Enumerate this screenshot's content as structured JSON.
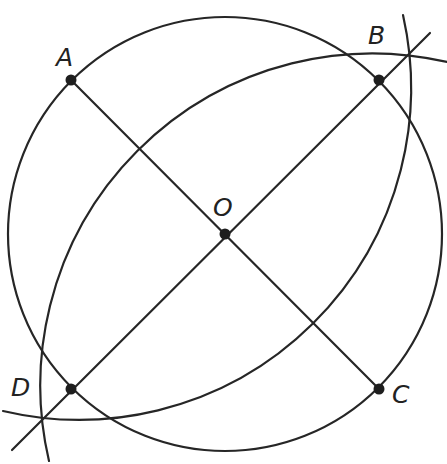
{
  "diagram": {
    "type": "geometric-construction",
    "stroke_color": "#262626",
    "point_color": "#1e1e1e",
    "circle": {
      "center": "O",
      "cx": 225,
      "cy": 234,
      "r": 217
    },
    "points": [
      {
        "id": "A",
        "label": "A",
        "x": 71,
        "y": 80,
        "label_x": 56,
        "label_y": 66
      },
      {
        "id": "B",
        "label": "B",
        "x": 379,
        "y": 80,
        "label_x": 368,
        "label_y": 44
      },
      {
        "id": "C",
        "label": "C",
        "x": 379,
        "y": 389,
        "label_x": 392,
        "label_y": 403
      },
      {
        "id": "D",
        "label": "D",
        "x": 71,
        "y": 389,
        "label_x": 11,
        "label_y": 396
      },
      {
        "id": "O",
        "label": "O",
        "x": 225,
        "y": 234,
        "label_x": 213,
        "label_y": 216
      }
    ],
    "segments": [
      {
        "name": "segment-AC",
        "from": "A",
        "to": "C"
      },
      {
        "name": "segment-BD-extended",
        "x1": 12,
        "y1": 450,
        "x2": 430,
        "y2": 33
      }
    ],
    "arcs": [
      {
        "name": "arc-centered-near-A",
        "cx": 75,
        "cy": 85,
        "r": 332
      },
      {
        "name": "arc-centered-near-C",
        "cx": 375,
        "cy": 385,
        "r": 332
      }
    ]
  }
}
